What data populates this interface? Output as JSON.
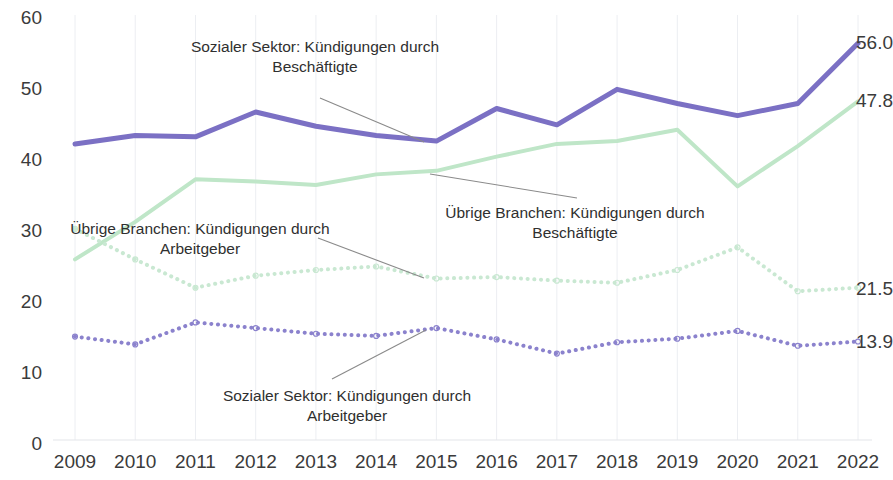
{
  "chart_data": {
    "type": "line",
    "title": "",
    "xlabel": "",
    "ylabel": "",
    "ylim": [
      0,
      60
    ],
    "ytick_values": [
      0,
      10,
      20,
      30,
      40,
      50,
      60
    ],
    "ytick_labels": [
      "0",
      "10",
      "20",
      "30",
      "40",
      "50",
      "60"
    ],
    "grid": "vertical-only",
    "legend": "annotations-inline",
    "categories": [
      "2009",
      "2010",
      "2011",
      "2012",
      "2013",
      "2014",
      "2015",
      "2016",
      "2017",
      "2018",
      "2019",
      "2020",
      "2021",
      "2022"
    ],
    "series": [
      {
        "name": "Sozialer Sektor: Kündigungen durch Beschäftigte",
        "color": "#7b70c4",
        "style": "solid",
        "width": 5,
        "values": [
          41.8,
          43.0,
          42.8,
          46.3,
          44.3,
          43.0,
          42.2,
          46.8,
          44.5,
          49.5,
          47.5,
          45.8,
          47.5,
          56.0
        ],
        "end_label": "56.0"
      },
      {
        "name": "Übrige Branchen: Kündigungen durch Beschäftigte",
        "color": "#bfe6c8",
        "style": "solid",
        "width": 4,
        "values": [
          25.5,
          30.8,
          36.8,
          36.5,
          36.0,
          37.5,
          38.0,
          40.0,
          41.8,
          42.2,
          43.8,
          35.8,
          41.5,
          47.8
        ],
        "end_label": "47.8"
      },
      {
        "name": "Übrige Branchen: Kündigungen durch Arbeitgeber",
        "color": "#c9e8d2",
        "style": "dotted",
        "width": 4,
        "values": [
          29.8,
          25.5,
          21.5,
          23.2,
          24.0,
          24.5,
          22.8,
          23.0,
          22.5,
          22.2,
          24.0,
          27.2,
          21.0,
          21.5
        ],
        "end_label": "21.5"
      },
      {
        "name": "Sozialer Sektor: Kündigungen durch Arbeitgeber",
        "color": "#8b82cd",
        "style": "dotted",
        "width": 4,
        "values": [
          14.6,
          13.5,
          16.6,
          15.8,
          15.0,
          14.7,
          15.8,
          14.2,
          12.2,
          13.8,
          14.3,
          15.4,
          13.3,
          13.9
        ],
        "end_label": "13.9"
      }
    ],
    "annotations": [
      {
        "id": "annot-sozialer-beschaeftigte",
        "text": "Sozialer Sektor: Kündigungen durch\nBeschäftigte",
        "target_series": "Sozialer Sektor: Kündigungen durch Beschäftigte",
        "target_year": "2015"
      },
      {
        "id": "annot-uebrige-beschaeftigte",
        "text": "Übrige Branchen: Kündigungen durch\nBeschäftigte",
        "target_series": "Übrige Branchen: Kündigungen durch Beschäftigte",
        "target_year": "2015"
      },
      {
        "id": "annot-uebrige-arbeitgeber",
        "text": "Übrige Branchen: Kündigungen durch\nArbeitgeber",
        "target_series": "Übrige Branchen: Kündigungen durch Arbeitgeber",
        "target_year": "2015"
      },
      {
        "id": "annot-sozialer-arbeitgeber",
        "text": "Sozialer Sektor: Kündigungen durch\nArbeitgeber",
        "target_series": "Sozialer Sektor: Kündigungen durch Arbeitgeber",
        "target_year": "2015"
      }
    ]
  }
}
